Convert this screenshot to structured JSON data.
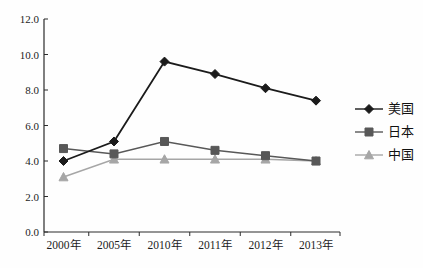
{
  "chart_data": {
    "type": "line",
    "title": "",
    "xlabel": "",
    "ylabel": "",
    "ylim": [
      0,
      12
    ],
    "ytick_step": 2,
    "ytick_labels": [
      "0.0",
      "2.0",
      "4.0",
      "6.0",
      "8.0",
      "10.0",
      "12.0"
    ],
    "grid": false,
    "legend_position": "right",
    "categories": [
      "2000年",
      "2005年",
      "2010年",
      "2011年",
      "2012年",
      "2013年"
    ],
    "series": [
      {
        "key": "us",
        "name": "美国",
        "marker": "diamond",
        "color": "#1b1b1b",
        "values": [
          4.0,
          5.1,
          9.6,
          8.9,
          8.1,
          7.4
        ]
      },
      {
        "key": "japan",
        "name": "日本",
        "marker": "square",
        "color": "#585858",
        "values": [
          4.7,
          4.4,
          5.1,
          4.6,
          4.3,
          4.0
        ]
      },
      {
        "key": "china",
        "name": "中国",
        "marker": "triangle",
        "color": "#a6a6a6",
        "values": [
          3.1,
          4.1,
          4.1,
          4.1,
          4.1,
          4.0
        ]
      }
    ]
  },
  "colors": {
    "axis": "#2b2b2b",
    "text": "#1c1c1c",
    "background": "#fefefe"
  }
}
